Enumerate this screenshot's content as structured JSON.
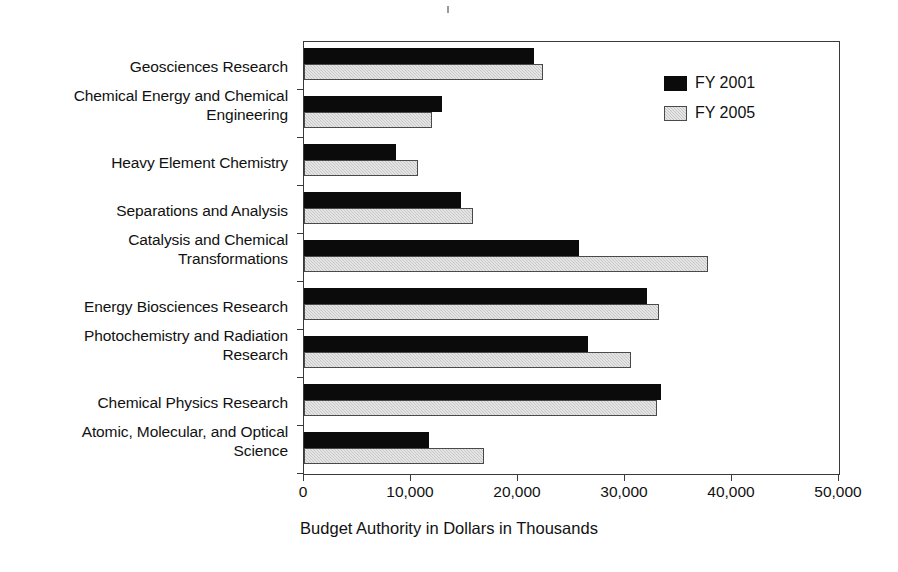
{
  "chart_data": {
    "type": "bar",
    "orientation": "horizontal",
    "title": "",
    "xlabel": "Budget Authority in Dollars in Thousands",
    "ylabel": "",
    "xlim": [
      0,
      50000
    ],
    "xticks": [
      0,
      10000,
      20000,
      30000,
      40000,
      50000
    ],
    "xticklabels": [
      "0",
      "10,000",
      "20,000",
      "30,000",
      "40,000",
      "50,000"
    ],
    "grid": false,
    "legend_position": "upper right",
    "categories": [
      "Geosciences Research",
      "Chemical Energy and Chemical Engineering",
      "Heavy Element Chemistry",
      "Separations and Analysis",
      "Catalysis and Chemical Transformations",
      "Energy Biosciences Research",
      "Photochemistry and Radiation Research",
      "Chemical Physics Research",
      "Atomic, Molecular, and Optical Science"
    ],
    "category_lines": [
      [
        "Geosciences Research"
      ],
      [
        "Chemical Energy and Chemical",
        "Engineering"
      ],
      [
        "Heavy Element Chemistry"
      ],
      [
        "Separations and Analysis"
      ],
      [
        "Catalysis and Chemical",
        "Transformations"
      ],
      [
        "Energy Biosciences Research"
      ],
      [
        "Photochemistry and Radiation",
        "Research"
      ],
      [
        "Chemical Physics Research"
      ],
      [
        "Atomic, Molecular, and Optical",
        "Science"
      ]
    ],
    "series": [
      {
        "name": "FY 2001",
        "color": "#0b0b0b",
        "values": [
          21500,
          12900,
          8600,
          14700,
          25700,
          32100,
          26500,
          33400,
          11700
        ]
      },
      {
        "name": "FY 2005",
        "color": "#c6c6c6",
        "values": [
          22300,
          12000,
          10700,
          15800,
          37800,
          33200,
          30600,
          33000,
          16800
        ]
      }
    ]
  }
}
